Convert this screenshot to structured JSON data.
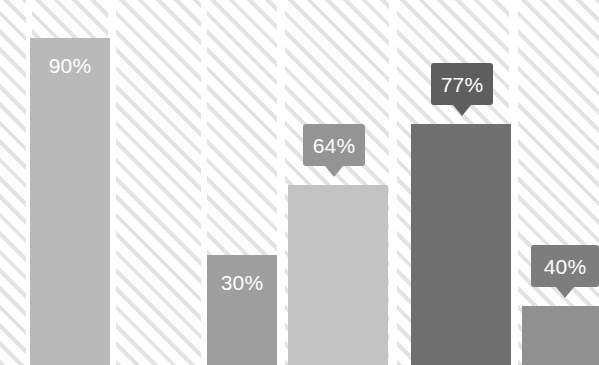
{
  "chart_data": {
    "type": "bar",
    "title": "",
    "subtitle": "",
    "xlabel": "",
    "ylabel": "",
    "ylim": [
      0,
      100
    ],
    "grid": false,
    "legend": null,
    "categories": [
      "",
      "",
      "",
      "",
      ""
    ],
    "values": [
      90,
      30,
      64,
      77,
      40
    ],
    "labels": [
      "90%",
      "30%",
      "64%",
      "77%",
      "40%"
    ],
    "label_style": [
      "inside",
      "inside",
      "callout",
      "callout",
      "callout"
    ],
    "bar_colors": [
      "#b9b9b9",
      "#9e9e9e",
      "#c3c3c3",
      "#6f6f6f",
      "#909090"
    ],
    "label_text_color": "#ffffff",
    "background": {
      "color": "#ffffff",
      "pattern": "diagonal-stripes",
      "stripe_color": "#e3e3e3"
    }
  },
  "bars": [
    {
      "name": "bar-1",
      "label": "90%",
      "value": 90,
      "color": "#b9b9b9",
      "x": 30,
      "width": 80,
      "top": 38,
      "label_style": "inside"
    },
    {
      "name": "bar-2",
      "label": "30%",
      "value": 30,
      "color": "#9e9e9e",
      "x": 207,
      "width": 70,
      "top": 255,
      "label_style": "inside"
    },
    {
      "name": "bar-3",
      "label": "64%",
      "value": 64,
      "color": "#c3c3c3",
      "x": 288,
      "width": 100,
      "top": 185,
      "label_style": "callout",
      "callout": {
        "x": 303,
        "y": 124,
        "w": 62,
        "h": 42,
        "color": "#949494"
      }
    },
    {
      "name": "bar-4",
      "label": "77%",
      "value": 77,
      "color": "#6f6f6f",
      "x": 411,
      "width": 100,
      "top": 124,
      "label_style": "callout",
      "callout": {
        "x": 431,
        "y": 63,
        "w": 62,
        "h": 42,
        "color": "#5e5e5e"
      }
    },
    {
      "name": "bar-5",
      "label": "40%",
      "value": 40,
      "color": "#909090",
      "x": 522,
      "width": 77,
      "top": 306,
      "label_style": "callout",
      "callout": {
        "x": 531,
        "y": 245,
        "w": 68,
        "h": 42,
        "color": "#7d7d7d"
      }
    }
  ],
  "hatch_columns": [
    {
      "x": 0,
      "w": 26
    },
    {
      "x": 32,
      "w": 76
    },
    {
      "x": 116,
      "w": 85
    },
    {
      "x": 207,
      "w": 70
    },
    {
      "x": 285,
      "w": 104
    },
    {
      "x": 397,
      "w": 112
    },
    {
      "x": 518,
      "w": 81
    }
  ]
}
